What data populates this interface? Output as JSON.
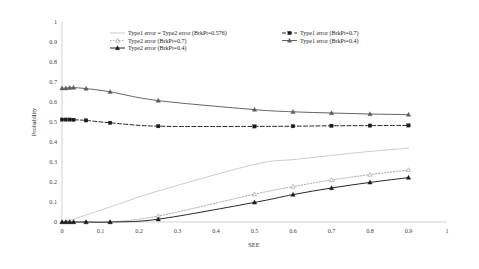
{
  "chart_data": {
    "type": "line",
    "title": "",
    "xlabel": "SEE",
    "ylabel": "Probability",
    "xlim": [
      0,
      1
    ],
    "ylim": [
      0,
      1
    ],
    "xticks": [
      "0",
      "0.1",
      "0.2",
      "0.3",
      "0.4",
      "0.5",
      "0.6",
      "0.7",
      "0.8",
      "0.9",
      "1"
    ],
    "yticks": [
      "0",
      "0.1",
      "0.2",
      "0.3",
      "0.4",
      "0.5",
      "0.6",
      "0.7",
      "0.8",
      "0.9",
      "1"
    ],
    "grid": false,
    "legend_position": "top-inside",
    "x": [
      0,
      0.01,
      0.02,
      0.03,
      0.0625,
      0.125,
      0.25,
      0.5,
      0.6,
      0.7,
      0.8,
      0.9
    ],
    "series": [
      {
        "name": "Type1 error = Type2 error (BrkPt=0.576)",
        "legend_label": "Type1 error = Type2 error (BrkPt=0.576)",
        "style": "solid",
        "color": "#c9c9c9",
        "marker": "none",
        "values": [
          0,
          0.004,
          0.009,
          0.014,
          0.035,
          0.075,
          0.155,
          0.288,
          0.312,
          0.333,
          0.353,
          0.369
        ]
      },
      {
        "name": "Type2 error (BrkPt=0.7)",
        "legend_label": "Type2 error (BrkPt=0.7)",
        "style": "dotted",
        "color": "#a5a5a5",
        "marker": "triangle-open",
        "values": [
          0,
          0,
          0,
          0,
          0,
          0,
          0.03,
          0.139,
          0.177,
          0.21,
          0.237,
          0.26
        ]
      },
      {
        "name": "Type2 error (BrkPt=0.4)",
        "legend_label": "Type2 error (BrkPt=0.4)",
        "style": "solid",
        "color": "#1a1a1a",
        "marker": "triangle-filled",
        "values": [
          0,
          0,
          0,
          0,
          0,
          0,
          0.014,
          0.098,
          0.137,
          0.17,
          0.198,
          0.222
        ]
      },
      {
        "name": "Type1 error (BrkPt=0.7)",
        "legend_label": "Type1 error (BrkPt=0.7)",
        "style": "dashed",
        "color": "#1a1a1a",
        "marker": "square-filled",
        "values": [
          0.512,
          0.512,
          0.512,
          0.511,
          0.508,
          0.496,
          0.479,
          0.478,
          0.479,
          0.481,
          0.482,
          0.483
        ]
      },
      {
        "name": "Type1 error (BrkPt=0.4)",
        "legend_label": "Type1 error (BrkPt=0.4)",
        "style": "solid",
        "color": "#5c5c5c",
        "marker": "triangle-filled",
        "values": [
          0.669,
          0.669,
          0.671,
          0.672,
          0.667,
          0.651,
          0.607,
          0.562,
          0.551,
          0.545,
          0.54,
          0.537
        ]
      }
    ],
    "legend_columns": [
      [
        "Type1 error = Type2 error (BrkPt=0.576)",
        "Type2 error (BrkPt=0.7)",
        "Type2 error (BrkPt=0.4)"
      ],
      [
        "Type1 error (BrkPt=0.7)",
        "Type1 error (BrkPt=0.4)"
      ]
    ]
  }
}
